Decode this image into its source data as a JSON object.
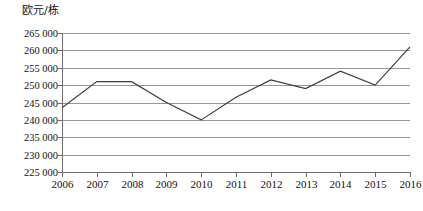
{
  "chart_data": {
    "type": "line",
    "title": "",
    "xlabel": "",
    "ylabel": "欧元/栋",
    "unit_label": "欧元/栋",
    "categories": [
      "2006",
      "2007",
      "2008",
      "2009",
      "2010",
      "2011",
      "2012",
      "2013",
      "2014",
      "2015",
      "2016"
    ],
    "values": [
      243500,
      251000,
      251000,
      245000,
      240000,
      246500,
      251500,
      249000,
      254000,
      250000,
      261000
    ],
    "series": [
      {
        "name": "欧元/栋",
        "values": [
          243500,
          251000,
          251000,
          245000,
          240000,
          246500,
          251500,
          249000,
          254000,
          250000,
          261000
        ]
      }
    ],
    "ylim": [
      225000,
      265000
    ],
    "ytick_step": 5000,
    "ytick_labels": [
      "225 000",
      "230 000",
      "235 000",
      "240 000",
      "245 000",
      "250 000",
      "255 000",
      "260 000",
      "265 000"
    ],
    "ytick_values": [
      225000,
      230000,
      235000,
      240000,
      245000,
      250000,
      255000,
      260000,
      265000
    ],
    "xtick_labels": [
      "2006",
      "2007",
      "2008",
      "2009",
      "2010",
      "2011",
      "2012",
      "2013",
      "2014",
      "2015",
      "2016"
    ],
    "grid": true,
    "grid_axis": "y",
    "legend": false,
    "legend_position": "none",
    "markers": false,
    "line_color": "#3d3d3d",
    "grid_color": "#8c8c8c",
    "axis_color": "#6e6e6e",
    "background_color": "#ffffff"
  },
  "layout": {
    "plot_left": 62,
    "plot_right": 410,
    "plot_top": 33,
    "plot_bottom": 172,
    "ytick_label_right": 58,
    "xtick_label_baseline": 188
  }
}
